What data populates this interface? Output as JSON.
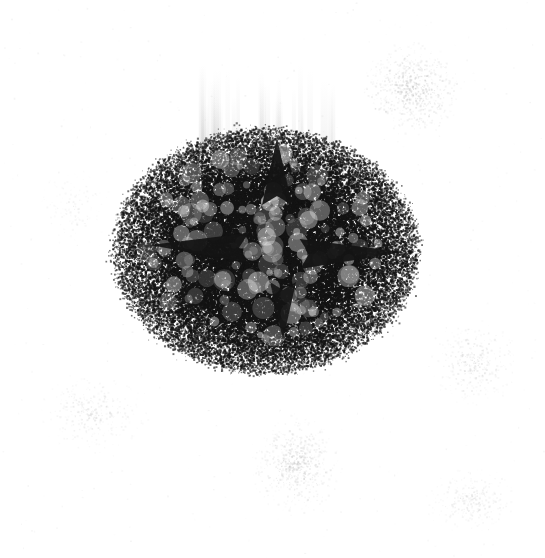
{
  "image": {
    "kind": "noisy-scan-artifact",
    "alt_text": "Heavily degraded grayscale scan: a dense dark granular blob on a white field, with four dark wedge spikes and faint peripheral speckle clusters.",
    "width": 545,
    "height": 558,
    "background_color": "#ffffff",
    "ink_color": "#141414",
    "halo_color": "#8a8a8a",
    "speckle_color": "#b9b9b9",
    "seed": 20240517
  },
  "blob": {
    "name": "central-ink-blob",
    "center_x": 265,
    "center_y": 250,
    "radius_x": 152,
    "radius_y": 122,
    "core_radius_x": 104,
    "core_radius_y": 86,
    "core_opacity": 0.97,
    "halo_falloff": 2.15,
    "grain_count": 52000,
    "grain_min_size": 0.6,
    "grain_max_size": 2.3,
    "mottle_count": 150,
    "mottle_min_radius": 3,
    "mottle_max_radius": 11,
    "mottle_lighten": 0.38
  },
  "spikes": [
    {
      "name": "spike-left",
      "direction": "left",
      "tip_x": 150,
      "tip_y": 245,
      "base_x": 248,
      "base_y": 248,
      "half_height": 15,
      "notch": 9,
      "opacity": 0.95
    },
    {
      "name": "spike-right",
      "direction": "right",
      "tip_x": 403,
      "tip_y": 252,
      "base_x": 300,
      "base_y": 254,
      "half_height": 15,
      "notch": 9,
      "opacity": 0.95
    },
    {
      "name": "spike-top",
      "direction": "up",
      "tip_x": 277,
      "tip_y": 138,
      "base_x": 277,
      "base_y": 205,
      "half_height": 15,
      "notch": 9,
      "opacity": 0.95
    },
    {
      "name": "spike-bottom",
      "direction": "down",
      "tip_x": 283,
      "tip_y": 340,
      "base_x": 283,
      "base_y": 282,
      "half_height": 13,
      "notch": 8,
      "opacity": 0.9
    }
  ],
  "streaks": {
    "name": "vertical-smear-streaks",
    "count": 26,
    "x_min": 198,
    "x_max": 345,
    "y_top": 62,
    "y_bottom": 150,
    "max_opacity": 0.1,
    "width_min": 2,
    "width_max": 9
  },
  "speckle_clusters": [
    {
      "name": "speckle-cluster-upper-right",
      "center_x": 412,
      "center_y": 88,
      "radius_x": 52,
      "radius_y": 48,
      "count": 1500,
      "max_opacity": 0.34
    },
    {
      "name": "speckle-cluster-bottom-center",
      "center_x": 296,
      "center_y": 464,
      "radius_x": 48,
      "radius_y": 52,
      "count": 1350,
      "max_opacity": 0.3
    },
    {
      "name": "speckle-cluster-lower-left",
      "center_x": 92,
      "center_y": 414,
      "radius_x": 56,
      "radius_y": 40,
      "count": 700,
      "max_opacity": 0.22
    },
    {
      "name": "speckle-cluster-right-lower",
      "center_x": 474,
      "center_y": 362,
      "radius_x": 44,
      "radius_y": 44,
      "count": 750,
      "max_opacity": 0.26
    },
    {
      "name": "speckle-cluster-far-lower-right",
      "center_x": 470,
      "center_y": 500,
      "radius_x": 48,
      "radius_y": 34,
      "count": 620,
      "max_opacity": 0.22
    },
    {
      "name": "speckle-cluster-left-mid",
      "center_x": 72,
      "center_y": 205,
      "radius_x": 38,
      "radius_y": 40,
      "count": 300,
      "max_opacity": 0.16
    }
  ],
  "stray_dust": {
    "name": "stray-dust-specks",
    "count": 420,
    "max_opacity": 0.16
  }
}
